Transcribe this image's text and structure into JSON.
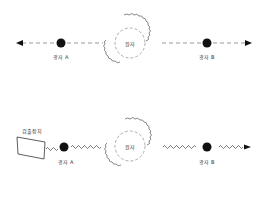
{
  "panels": [
    {
      "id": "top",
      "source_label": "원자",
      "particle_a_label": "광자 A",
      "particle_b_label": "광자 B",
      "propagation": "dashed-arrows"
    },
    {
      "id": "bottom",
      "source_label": "원자",
      "particle_a_label": "광자 A",
      "particle_b_label": "광자 B",
      "detector_label": "검출장치",
      "propagation": "wavy-lines"
    }
  ],
  "colors": {
    "stroke": "#555555",
    "dot": "#111111",
    "dashed": "#999999"
  }
}
